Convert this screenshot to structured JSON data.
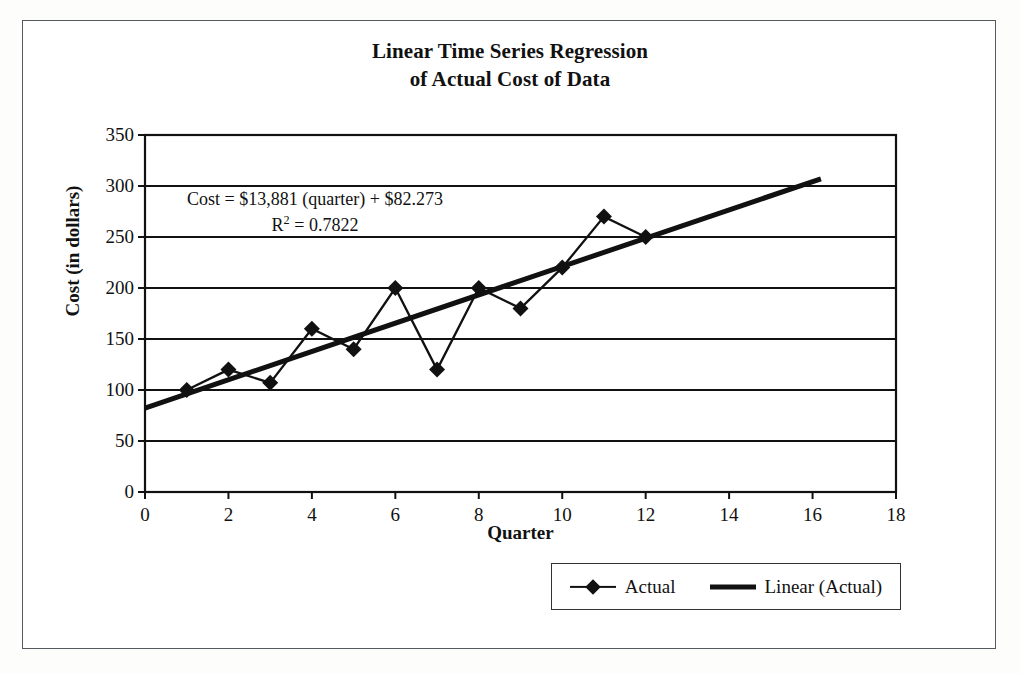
{
  "figure": {
    "title_line1": "Linear Time Series Regression",
    "title_line2": "of Actual Cost of Data",
    "frame_color": "#555a5e",
    "background": "#ffffff"
  },
  "annotation": {
    "equation": "Cost = $13,881 (quarter) + $82.273",
    "r_squared_label": "R",
    "r_squared_exponent": "2",
    "r_squared_value": "= 0.7822"
  },
  "legend": {
    "entries": [
      {
        "label": "Actual",
        "key": "line-with-diamond-marker",
        "color": "#111111"
      },
      {
        "label": "Linear (Actual)",
        "key": "thick-line",
        "color": "#111111"
      }
    ]
  },
  "chart_data": {
    "type": "line",
    "title": "Linear Time Series Regression of Actual Cost of Data",
    "xlabel": "Quarter",
    "ylabel": "Cost (in dollars)",
    "xlim": [
      0,
      18
    ],
    "ylim": [
      0,
      350
    ],
    "xticks": [
      0,
      2,
      4,
      6,
      8,
      10,
      12,
      14,
      16,
      18
    ],
    "yticks": [
      0,
      50,
      100,
      150,
      200,
      250,
      300,
      350
    ],
    "grid": "horizontal",
    "legend_position": "bottom-right",
    "annotations": [
      "Cost = $13,881 (quarter) + $82.273",
      "R2 = 0.7822"
    ],
    "series": [
      {
        "name": "Actual",
        "type": "line-marker",
        "marker": "diamond",
        "color": "#111111",
        "x": [
          1,
          2,
          3,
          4,
          5,
          6,
          7,
          8,
          9,
          10,
          11,
          12
        ],
        "values": [
          100,
          120,
          107,
          160,
          140,
          200,
          120,
          200,
          180,
          220,
          270,
          250
        ]
      },
      {
        "name": "Linear (Actual)",
        "type": "trendline",
        "color": "#111111",
        "slope": 13.881,
        "intercept": 82.273,
        "r_squared": 0.7822,
        "x": [
          0,
          16.2
        ],
        "values": [
          82.273,
          307.1
        ]
      }
    ]
  }
}
